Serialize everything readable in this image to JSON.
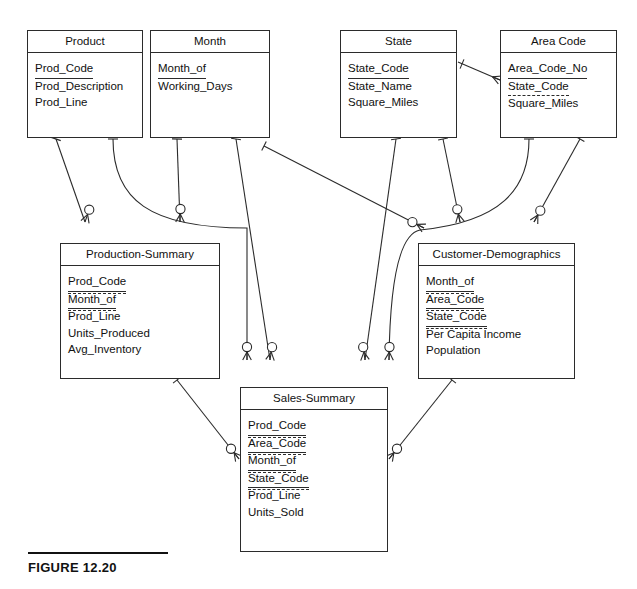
{
  "figure": {
    "caption": "FIGURE 12.20",
    "notation": "Crow's Foot ERD",
    "line_color": "#2b2b2b",
    "background": "#ffffff"
  },
  "entities": [
    {
      "id": "product",
      "title": "Product",
      "x": 27,
      "y": 30,
      "w": 116,
      "h": 108,
      "attributes": [
        {
          "name": "Prod_Code",
          "key": "pk"
        },
        {
          "name": "Prod_Description",
          "key": "none"
        },
        {
          "name": "Prod_Line",
          "key": "none"
        }
      ]
    },
    {
      "id": "month",
      "title": "Month",
      "x": 150,
      "y": 30,
      "w": 120,
      "h": 108,
      "attributes": [
        {
          "name": "Month_of",
          "key": "pk"
        },
        {
          "name": "Working_Days",
          "key": "none"
        }
      ]
    },
    {
      "id": "state",
      "title": "State",
      "x": 340,
      "y": 30,
      "w": 117,
      "h": 108,
      "attributes": [
        {
          "name": "State_Code",
          "key": "pk"
        },
        {
          "name": "State_Name",
          "key": "none"
        },
        {
          "name": "Square_Miles",
          "key": "none"
        }
      ]
    },
    {
      "id": "area-code",
      "title": "Area Code",
      "x": 500,
      "y": 30,
      "w": 117,
      "h": 108,
      "attributes": [
        {
          "name": "Area_Code_No",
          "key": "pk"
        },
        {
          "name": "State_Code",
          "key": "fk"
        },
        {
          "name": "Square_Miles",
          "key": "none"
        }
      ]
    },
    {
      "id": "production-summary",
      "title": "Production-Summary",
      "x": 60,
      "y": 243,
      "w": 160,
      "h": 136,
      "attributes": [
        {
          "name": "Prod_Code",
          "key": "pkfk"
        },
        {
          "name": "Month_of",
          "key": "pkfk"
        },
        {
          "name": "Prod_Line",
          "key": "none"
        },
        {
          "name": "Units_Produced",
          "key": "none"
        },
        {
          "name": "Avg_Inventory",
          "key": "none"
        }
      ]
    },
    {
      "id": "customer-demographics",
      "title": "Customer-Demographics",
      "x": 418,
      "y": 243,
      "w": 157,
      "h": 136,
      "attributes": [
        {
          "name": "Month_of",
          "key": "pkfk"
        },
        {
          "name": "Area_Code",
          "key": "pkfk"
        },
        {
          "name": "State_Code",
          "key": "pkfk"
        },
        {
          "name": "Per Capita Income",
          "key": "none"
        },
        {
          "name": "Population",
          "key": "none"
        }
      ]
    },
    {
      "id": "sales-summary",
      "title": "Sales-Summary",
      "x": 240,
      "y": 387,
      "w": 148,
      "h": 165,
      "attributes": [
        {
          "name": "Prod_Code",
          "key": "pkfk"
        },
        {
          "name": "Area_Code",
          "key": "pkfk"
        },
        {
          "name": "Month_of",
          "key": "pkfk"
        },
        {
          "name": "State_Code",
          "key": "pkfk"
        },
        {
          "name": "Prod_Line",
          "key": "none"
        },
        {
          "name": "Units_Sold",
          "key": "none"
        }
      ]
    }
  ],
  "relationships": [
    {
      "id": "product-production-summary",
      "parent": "Product",
      "child": "Production-Summary",
      "parent_cardinality": "1",
      "child_cardinality": "0..M",
      "path": "M 56,139 L 85,222",
      "one_at": {
        "x": 56,
        "y": 139,
        "angle": 109
      },
      "many_at": {
        "x": 85,
        "y": 222,
        "angle": 109
      }
    },
    {
      "id": "product-sales-summary",
      "parent": "Product",
      "child": "Sales-Summary",
      "parent_cardinality": "1",
      "child_cardinality": "0..M",
      "path": "M 113,139 C 113,200 150,228 247,228 L 247,360",
      "one_at": {
        "x": 113,
        "y": 139,
        "angle": 90
      },
      "many_at": {
        "x": 247,
        "y": 360,
        "angle": 90
      }
    },
    {
      "id": "month-production-summary",
      "parent": "Month",
      "child": "Production-Summary",
      "parent_cardinality": "1",
      "child_cardinality": "0..M",
      "path": "M 177,139 L 180,222",
      "one_at": {
        "x": 177,
        "y": 139,
        "angle": 92
      },
      "many_at": {
        "x": 180,
        "y": 222,
        "angle": 92
      }
    },
    {
      "id": "month-sales-summary",
      "parent": "Month",
      "child": "Sales-Summary",
      "parent_cardinality": "1",
      "child_cardinality": "0..M",
      "path": "M 236,139 L 270,360",
      "one_at": {
        "x": 236,
        "y": 139,
        "angle": 99
      },
      "many_at": {
        "x": 270,
        "y": 360,
        "angle": 99
      }
    },
    {
      "id": "month-customer-demographics",
      "parent": "Month",
      "child": "Customer-Demographics",
      "parent_cardinality": "1",
      "child_cardinality": "0..M",
      "path": "M 264,146 L 424,228",
      "one_at": {
        "x": 264,
        "y": 146,
        "angle": 27
      },
      "many_at": {
        "x": 424,
        "y": 228,
        "angle": 27
      }
    },
    {
      "id": "state-sales-summary",
      "parent": "State",
      "child": "Sales-Summary",
      "parent_cardinality": "1",
      "child_cardinality": "0..M",
      "path": "M 396,139 L 365,360",
      "one_at": {
        "x": 396,
        "y": 139,
        "angle": 82
      },
      "many_at": {
        "x": 365,
        "y": 360,
        "angle": 82
      }
    },
    {
      "id": "state-customer-demographics",
      "parent": "State",
      "child": "Customer-Demographics",
      "parent_cardinality": "1",
      "child_cardinality": "0..M",
      "path": "M 443,139 L 460,222",
      "one_at": {
        "x": 443,
        "y": 139,
        "angle": 78
      },
      "many_at": {
        "x": 460,
        "y": 222,
        "angle": 78
      }
    },
    {
      "id": "state-area-code",
      "parent": "State",
      "child": "Area Code",
      "parent_cardinality": "1",
      "child_cardinality": "M",
      "path": "M 458,62 L 500,80",
      "one_at": {
        "x": 462,
        "y": 64,
        "angle": 23
      },
      "many_at": {
        "x": 500,
        "y": 80,
        "angle": 23
      }
    },
    {
      "id": "areacode-sales-summary",
      "parent": "Area Code",
      "child": "Sales-Summary",
      "parent_cardinality": "1",
      "child_cardinality": "0..M",
      "path": "M 529,139 C 529,190 500,222 420,230 C 400,234 390,280 389,360",
      "one_at": {
        "x": 529,
        "y": 139,
        "angle": 90
      },
      "many_at": {
        "x": 389,
        "y": 360,
        "angle": 92
      }
    },
    {
      "id": "areacode-customer-demographics",
      "parent": "Area Code",
      "child": "Customer-Demographics",
      "parent_cardinality": "1",
      "child_cardinality": "0..M",
      "path": "M 580,139 L 534,222",
      "one_at": {
        "x": 580,
        "y": 139,
        "angle": 119
      },
      "many_at": {
        "x": 534,
        "y": 222,
        "angle": 119
      }
    },
    {
      "id": "production-summary-sales-summary",
      "parent": "Production-Summary",
      "child": "Sales-Summary",
      "parent_cardinality": "1",
      "child_cardinality": "0..M",
      "path": "M 177,380 L 239,459",
      "one_at": {
        "x": 177,
        "y": 380,
        "angle": 52
      },
      "many_at": {
        "x": 239,
        "y": 459,
        "angle": 52
      }
    },
    {
      "id": "customer-demographics-sales-summary",
      "parent": "Customer-Demographics",
      "child": "Sales-Summary",
      "parent_cardinality": "1",
      "child_cardinality": "0..M",
      "path": "M 452,380 L 389,459",
      "one_at": {
        "x": 452,
        "y": 380,
        "angle": 128
      },
      "many_at": {
        "x": 389,
        "y": 459,
        "angle": 128
      }
    }
  ]
}
